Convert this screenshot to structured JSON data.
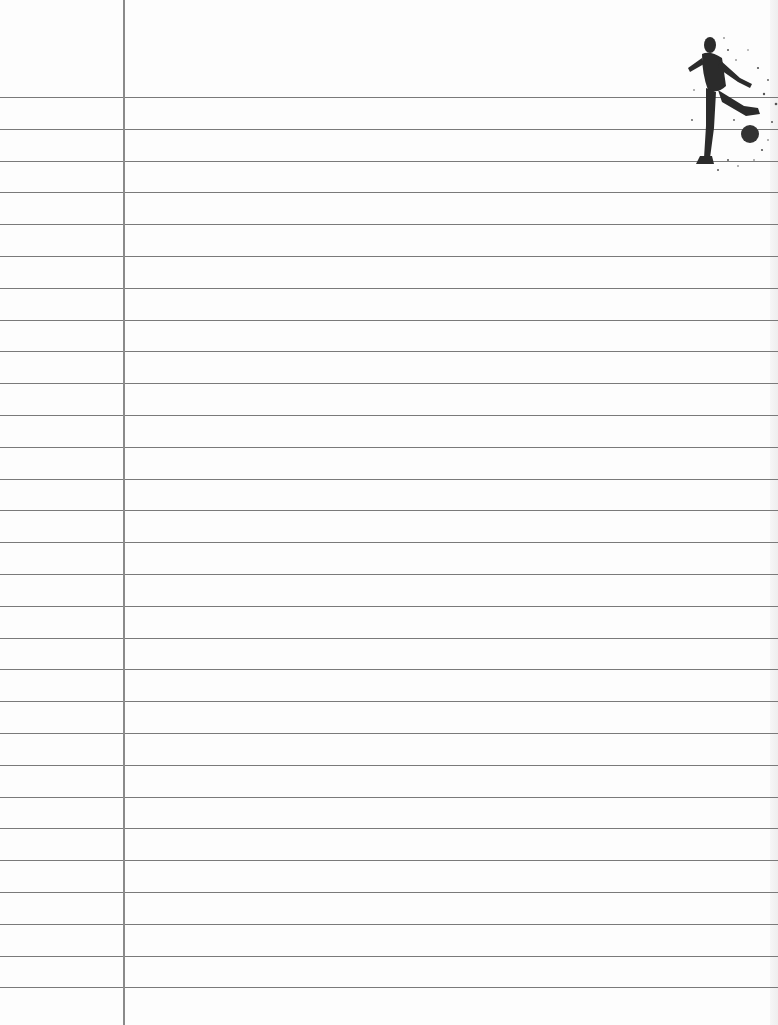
{
  "paper": {
    "type": "lined-notebook-paper",
    "background_color": "#fdfdfd",
    "rule_color": "#7a7a7a",
    "margin_line_color": "#8a8a8a",
    "margin_line_x": 123,
    "first_rule_y": 97,
    "rule_spacing": 31.8,
    "rule_count": 29
  },
  "decoration": {
    "icon": "soccer-player-kicking-ball-icon",
    "position": "top-right"
  }
}
